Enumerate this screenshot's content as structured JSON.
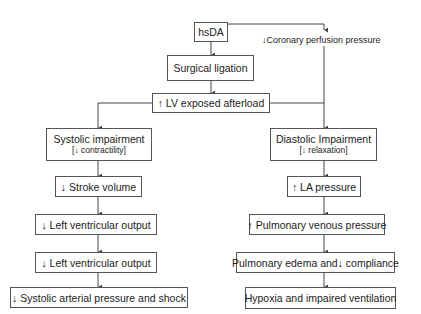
{
  "diagram": {
    "root": "hsDA",
    "side_note": "↓Coronary perfusion pressure",
    "step1": "Surgical ligation",
    "step2": "↑ LV exposed afterload",
    "left": {
      "title": "Systolic impairment",
      "subtitle": "[↓ contractility]",
      "steps": [
        "↓ Stroke volume",
        "↓ Left ventricular output",
        "↓ Left ventricular output",
        "↓  Systolic arterial pressure and shock"
      ]
    },
    "right": {
      "title": "Diastolic Impairment",
      "subtitle": "[↓ relaxation]",
      "steps": [
        "↑ LA pressure",
        "↑ Pulmonary venous pressure",
        "Pulmonary edema and↓ compliance",
        "Hypoxia and impaired ventilation"
      ]
    },
    "line_color": "#444444"
  }
}
